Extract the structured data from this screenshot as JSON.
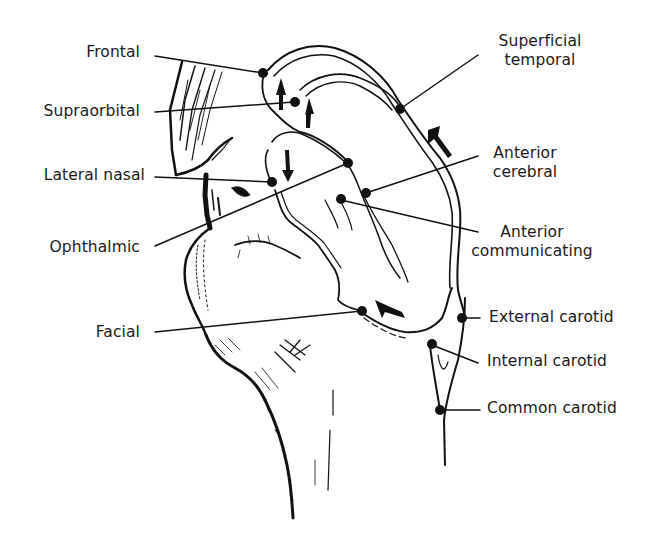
{
  "diagram": {
    "type": "anatomical-illustration",
    "labels": [
      {
        "id": "frontal",
        "text": "Frontal",
        "side": "left"
      },
      {
        "id": "supraorbital",
        "text": "Supraorbital",
        "side": "left"
      },
      {
        "id": "lateral-nasal",
        "text": "Lateral nasal",
        "side": "left"
      },
      {
        "id": "ophthalmic",
        "text": "Ophthalmic",
        "side": "left"
      },
      {
        "id": "facial",
        "text": "Facial",
        "side": "left"
      },
      {
        "id": "superficial-temporal",
        "line1": "Superficial",
        "line2": "temporal",
        "side": "right"
      },
      {
        "id": "anterior-cerebral",
        "line1": "Anterior",
        "line2": "cerebral",
        "side": "right"
      },
      {
        "id": "anterior-communicating",
        "line1": "Anterior",
        "line2": "communicating",
        "side": "right"
      },
      {
        "id": "external-carotid",
        "text": "External carotid",
        "side": "right"
      },
      {
        "id": "internal-carotid",
        "text": "Internal carotid",
        "side": "right"
      },
      {
        "id": "common-carotid",
        "text": "Common carotid",
        "side": "right"
      }
    ],
    "colors": {
      "ink": "#111111",
      "background": "#ffffff",
      "text": "#1a1a1a"
    }
  }
}
